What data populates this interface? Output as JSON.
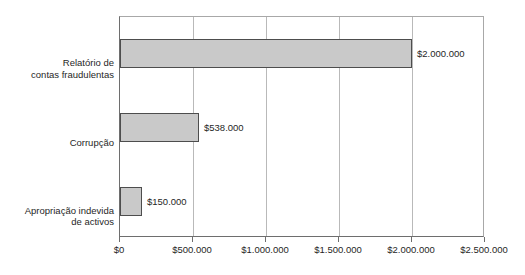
{
  "chart_data": {
    "type": "bar",
    "orientation": "horizontal",
    "title": "",
    "subtitle": "",
    "xlabel": "",
    "ylabel": "",
    "grid": true,
    "legend": false,
    "xlim": [
      0,
      2500000
    ],
    "categories": [
      "Relatório de\ncontas fraudulentas",
      "Corrupção",
      "Apropriação indevida\nde activos"
    ],
    "values": [
      2000000,
      538000,
      150000
    ],
    "data_labels": [
      "$2.000.000",
      "$538.000",
      "$150.000"
    ],
    "xticks": [
      0,
      500000,
      1000000,
      1500000,
      2000000,
      2500000
    ],
    "xticklabels": [
      "$0",
      "$500.000",
      "$1.000.000",
      "$1.500.000",
      "$2.000.000",
      "$2.500.000"
    ],
    "colors": {
      "bar_fill": "#c9c9c9",
      "bar_border": "#4d4d4d",
      "gridline": "#b9b9b9",
      "axis": "#6e6e6e",
      "text": "#1f1f1f",
      "background": "#ffffff"
    }
  }
}
